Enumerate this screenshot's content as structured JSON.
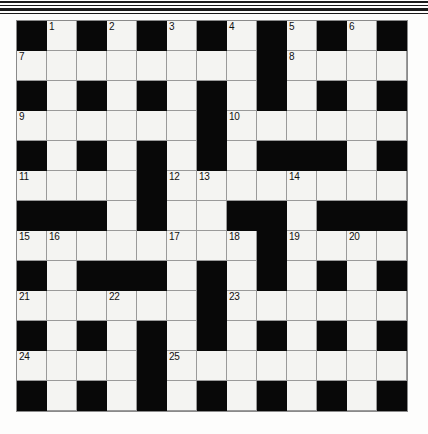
{
  "page": {
    "decoration": {
      "top_rules": [
        "rule-thick",
        "rule-thin",
        "rule-thick",
        "rule-thin"
      ]
    }
  },
  "grid": {
    "columns": 13,
    "rows": 13,
    "cell_size_px": 30,
    "colors": {
      "white_cell": "#f4f4f2",
      "black_cell": "#080808",
      "grid_line": "#9a9a9a",
      "number_text": "#111111",
      "page_background": "#fdfdfc"
    },
    "legend": {
      "1": "white (fillable) square",
      "0": "black (blocked) square"
    },
    "layout": [
      [
        0,
        1,
        0,
        1,
        0,
        1,
        0,
        1,
        0,
        1,
        0,
        1,
        0
      ],
      [
        1,
        1,
        1,
        1,
        1,
        1,
        1,
        1,
        0,
        1,
        1,
        1,
        1
      ],
      [
        0,
        1,
        0,
        1,
        0,
        1,
        0,
        1,
        0,
        1,
        0,
        1,
        0
      ],
      [
        1,
        1,
        1,
        1,
        1,
        1,
        0,
        1,
        1,
        1,
        1,
        1,
        1
      ],
      [
        0,
        1,
        0,
        1,
        0,
        1,
        0,
        1,
        0,
        0,
        0,
        1,
        0
      ],
      [
        1,
        1,
        1,
        1,
        0,
        1,
        1,
        1,
        1,
        1,
        1,
        1,
        1
      ],
      [
        0,
        0,
        0,
        1,
        0,
        1,
        1,
        0,
        0,
        1,
        0,
        0,
        0
      ],
      [
        1,
        1,
        1,
        1,
        1,
        1,
        1,
        1,
        0,
        1,
        1,
        1,
        1
      ],
      [
        0,
        1,
        0,
        0,
        0,
        1,
        0,
        1,
        0,
        1,
        0,
        1,
        0
      ],
      [
        1,
        1,
        1,
        1,
        1,
        1,
        0,
        1,
        1,
        1,
        1,
        1,
        1
      ],
      [
        0,
        1,
        0,
        1,
        0,
        1,
        0,
        1,
        0,
        1,
        0,
        1,
        0
      ],
      [
        1,
        1,
        1,
        1,
        0,
        1,
        1,
        1,
        1,
        1,
        1,
        1,
        1
      ],
      [
        0,
        1,
        0,
        1,
        0,
        1,
        0,
        1,
        0,
        1,
        0,
        1,
        0
      ]
    ],
    "numbers": [
      {
        "row": 0,
        "col": 1,
        "label": "1"
      },
      {
        "row": 0,
        "col": 3,
        "label": "2"
      },
      {
        "row": 0,
        "col": 5,
        "label": "3"
      },
      {
        "row": 0,
        "col": 7,
        "label": "4"
      },
      {
        "row": 0,
        "col": 9,
        "label": "5"
      },
      {
        "row": 0,
        "col": 11,
        "label": "6"
      },
      {
        "row": 1,
        "col": 0,
        "label": "7"
      },
      {
        "row": 1,
        "col": 9,
        "label": "8"
      },
      {
        "row": 3,
        "col": 0,
        "label": "9"
      },
      {
        "row": 3,
        "col": 7,
        "label": "10"
      },
      {
        "row": 5,
        "col": 0,
        "label": "11"
      },
      {
        "row": 5,
        "col": 5,
        "label": "12"
      },
      {
        "row": 5,
        "col": 6,
        "label": "13"
      },
      {
        "row": 5,
        "col": 9,
        "label": "14"
      },
      {
        "row": 7,
        "col": 0,
        "label": "15"
      },
      {
        "row": 7,
        "col": 1,
        "label": "16"
      },
      {
        "row": 7,
        "col": 5,
        "label": "17"
      },
      {
        "row": 7,
        "col": 7,
        "label": "18"
      },
      {
        "row": 7,
        "col": 9,
        "label": "19"
      },
      {
        "row": 7,
        "col": 11,
        "label": "20"
      },
      {
        "row": 9,
        "col": 0,
        "label": "21"
      },
      {
        "row": 9,
        "col": 3,
        "label": "22"
      },
      {
        "row": 9,
        "col": 7,
        "label": "23"
      },
      {
        "row": 11,
        "col": 0,
        "label": "24"
      },
      {
        "row": 11,
        "col": 5,
        "label": "25"
      }
    ]
  }
}
